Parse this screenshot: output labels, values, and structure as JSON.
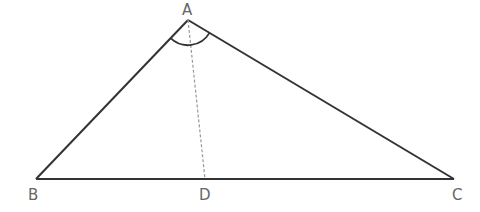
{
  "diagram": {
    "type": "triangle",
    "vertices": [
      {
        "name": "A",
        "label": "A",
        "x": 188,
        "y": 20
      },
      {
        "name": "B",
        "label": "B",
        "x": 36,
        "y": 179
      },
      {
        "name": "C",
        "label": "C",
        "x": 454,
        "y": 179
      },
      {
        "name": "D",
        "label": "D",
        "x": 205,
        "y": 179
      }
    ],
    "segments": [
      {
        "from": "A",
        "to": "B",
        "style": "solid"
      },
      {
        "from": "A",
        "to": "C",
        "style": "solid"
      },
      {
        "from": "B",
        "to": "C",
        "style": "solid"
      },
      {
        "from": "A",
        "to": "D",
        "style": "dashed"
      }
    ],
    "angle_marks": [
      {
        "vertex": "A",
        "between": [
          "B",
          "C"
        ],
        "type": "arc"
      }
    ],
    "colors": {
      "line": "#333333",
      "dashed": "#999999",
      "label": "#666666"
    }
  }
}
